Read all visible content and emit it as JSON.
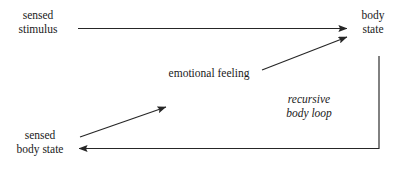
{
  "diagram": {
    "type": "flow-diagram",
    "background_color": "#ffffff",
    "stroke_color": "#262626",
    "text_color": "#1a1a1a",
    "nodes": [
      {
        "id": "sensed-stimulus",
        "label_line1": "sensed",
        "label_line2": "stimulus"
      },
      {
        "id": "body-state",
        "label_line1": "body",
        "label_line2": "state"
      },
      {
        "id": "sensed-body-state",
        "label_line1": "sensed",
        "label_line2": "body state"
      }
    ],
    "edge_labels": [
      {
        "id": "emotional-feeling",
        "text": "emotional feeling",
        "style": "roman"
      },
      {
        "id": "recursive-body-loop",
        "line1": "recursive",
        "line2": "body loop",
        "style": "italic"
      }
    ],
    "edges": [
      {
        "id": "stimulus-to-body-state",
        "from": "sensed stimulus",
        "to": "body state",
        "shape": "horizontal",
        "arrow": "end"
      },
      {
        "id": "emotional-feeling-to-body-state",
        "from": "emotional feeling",
        "to": "body state",
        "shape": "diagonal-up",
        "arrow": "end"
      },
      {
        "id": "sensed-body-state-to-emotional-feeling",
        "from": "sensed body state",
        "to": "emotional feeling",
        "shape": "diagonal-up",
        "arrow": "end"
      },
      {
        "id": "recursive-body-loop-return",
        "from": "body state",
        "to": "sensed body state",
        "shape": "elbow-down-left",
        "arrow": "end"
      }
    ]
  }
}
